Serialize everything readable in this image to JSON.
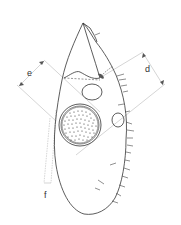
{
  "figure": {
    "type": "morphological line drawing",
    "labels": {
      "d": "d",
      "e": "e",
      "f": "f"
    },
    "colors": {
      "outline": "#333333",
      "measure_line": "#999999",
      "background": "#ffffff"
    }
  }
}
